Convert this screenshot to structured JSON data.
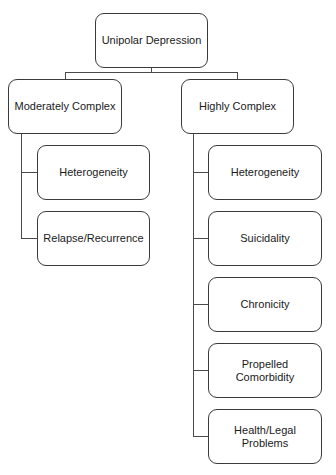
{
  "diagram": {
    "type": "hierarchy-tree",
    "root": {
      "label": "Unipolar Depression"
    },
    "branches": [
      {
        "label": "Moderately Complex",
        "children": [
          {
            "label": "Heterogeneity"
          },
          {
            "label": "Relapse/Recurrence"
          }
        ]
      },
      {
        "label": "Highly Complex",
        "children": [
          {
            "label": "Heterogeneity"
          },
          {
            "label": "Suicidality"
          },
          {
            "label": "Chronicity"
          },
          {
            "label": "Propelled Comorbidity"
          },
          {
            "label": "Health/Legal Problems"
          }
        ]
      }
    ]
  },
  "colors": {
    "stroke": "#3a3a3a",
    "background": "#ffffff",
    "text": "#1a1a1a"
  }
}
